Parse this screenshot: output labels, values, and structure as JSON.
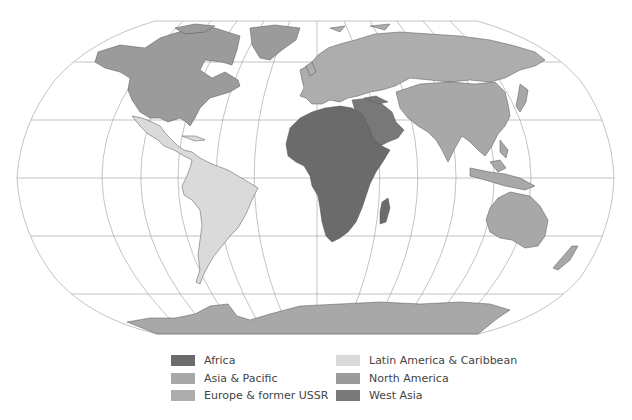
{
  "map": {
    "projection": "Robinson-like world map",
    "regions": [
      {
        "id": "africa",
        "name": "Africa",
        "color": "#6b6b6b"
      },
      {
        "id": "asia-pacific",
        "name": "Asia & Pacific",
        "color": "#a8a8a8"
      },
      {
        "id": "europe-ussr",
        "name": "Europe & former USSR",
        "color": "#adadad"
      },
      {
        "id": "latin-america",
        "name": "Latin America & Caribbean",
        "color": "#dadada"
      },
      {
        "id": "north-america",
        "name": "North America",
        "color": "#9b9b9b"
      },
      {
        "id": "west-asia",
        "name": "West Asia",
        "color": "#787878"
      }
    ]
  },
  "legend": {
    "items": [
      {
        "label": "Africa",
        "color": "#6b6b6b"
      },
      {
        "label": "Asia & Pacific",
        "color": "#a8a8a8"
      },
      {
        "label": "Europe & former USSR",
        "color": "#adadad"
      },
      {
        "label": "Latin America & Caribbean",
        "color": "#dadada"
      },
      {
        "label": "North America",
        "color": "#9b9b9b"
      },
      {
        "label": "West Asia",
        "color": "#787878"
      }
    ]
  }
}
